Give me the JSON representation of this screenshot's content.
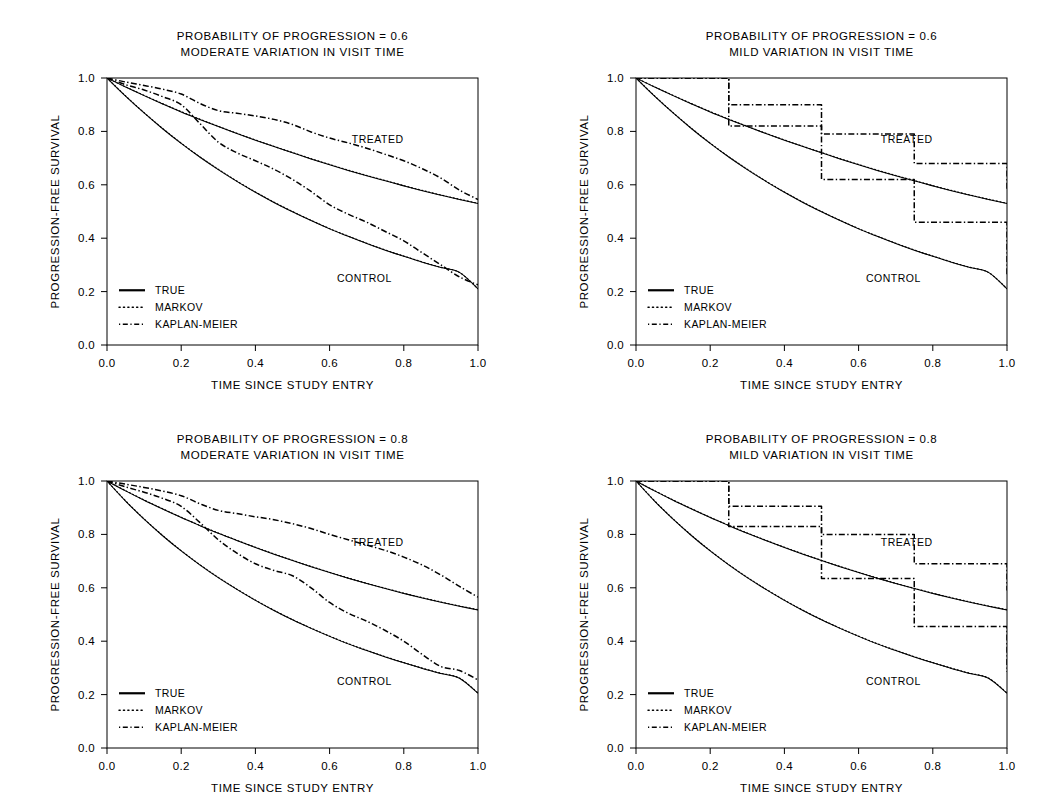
{
  "figure": {
    "name": "progression-free-survival-simulation",
    "panel_count": 4,
    "background_color": "#ffffff",
    "ink_color": "#000000"
  },
  "axes": {
    "xlabel": "TIME SINCE STUDY ENTRY",
    "ylabel": "PROGRESSION-FREE SURVIVAL",
    "xticks": [
      "0.0",
      "0.2",
      "0.4",
      "0.6",
      "0.8",
      "1.0"
    ],
    "xtick_values": [
      0.0,
      0.2,
      0.4,
      0.6,
      0.8,
      1.0
    ],
    "yticks": [
      "0.0",
      "0.2",
      "0.4",
      "0.6",
      "0.8",
      "1.0"
    ],
    "ytick_values": [
      0.0,
      0.2,
      0.4,
      0.6,
      0.8,
      1.0
    ],
    "xlim": [
      0.0,
      1.0
    ],
    "ylim": [
      0.0,
      1.0
    ],
    "grid": false
  },
  "legend": {
    "position": "bottom-left",
    "entries": [
      {
        "label": "TRUE",
        "style": "solid",
        "series_key": "true"
      },
      {
        "label": "MARKOV",
        "style": "dotted",
        "series_key": "markov"
      },
      {
        "label": "KAPLAN-MEIER",
        "style": "dash-dot",
        "series_key": "kaplan_meier"
      }
    ]
  },
  "annotations": {
    "treated": "TREATED",
    "control": "CONTROL"
  },
  "chart_data": [
    {
      "id": "panel-top-left",
      "type": "line",
      "title_line1": "PROBABILITY OF PROGRESSION = 0.6",
      "title_line2": "MODERATE VARIATION IN VISIT TIME",
      "probability_of_progression": 0.6,
      "visit_time_variation": "MODERATE",
      "xlabel": "TIME SINCE STUDY ENTRY",
      "ylabel": "PROGRESSION-FREE SURVIVAL",
      "xlim": [
        0.0,
        1.0
      ],
      "ylim": [
        0.0,
        1.0
      ],
      "x": [
        0.0,
        0.05,
        0.1,
        0.15,
        0.2,
        0.25,
        0.3,
        0.35,
        0.4,
        0.45,
        0.5,
        0.55,
        0.6,
        0.65,
        0.7,
        0.75,
        0.8,
        0.85,
        0.9,
        0.95,
        1.0
      ],
      "series": [
        {
          "name": "TRUE",
          "arm": "TREATED",
          "style": "solid",
          "values": [
            1.0,
            0.966,
            0.934,
            0.903,
            0.873,
            0.845,
            0.818,
            0.792,
            0.767,
            0.743,
            0.72,
            0.697,
            0.675,
            0.654,
            0.634,
            0.615,
            0.596,
            0.578,
            0.561,
            0.545,
            0.53
          ]
        },
        {
          "name": "MARKOV",
          "arm": "TREATED",
          "style": "dotted",
          "values": [
            1.0,
            0.967,
            0.935,
            0.904,
            0.874,
            0.846,
            0.819,
            0.793,
            0.768,
            0.744,
            0.721,
            0.698,
            0.676,
            0.655,
            0.635,
            0.616,
            0.597,
            0.579,
            0.562,
            0.546,
            0.531
          ]
        },
        {
          "name": "KAPLAN-MEIER",
          "arm": "TREATED",
          "style": "dash-dot",
          "values": [
            1.0,
            0.985,
            0.972,
            0.958,
            0.94,
            0.905,
            0.878,
            0.868,
            0.858,
            0.845,
            0.826,
            0.798,
            0.775,
            0.757,
            0.737,
            0.714,
            0.69,
            0.66,
            0.625,
            0.58,
            0.545
          ]
        },
        {
          "name": "TRUE",
          "arm": "CONTROL",
          "style": "solid",
          "values": [
            1.0,
            0.932,
            0.869,
            0.81,
            0.755,
            0.704,
            0.657,
            0.613,
            0.572,
            0.534,
            0.499,
            0.466,
            0.435,
            0.407,
            0.38,
            0.355,
            0.332,
            0.31,
            0.29,
            0.272,
            0.21
          ]
        },
        {
          "name": "MARKOV",
          "arm": "CONTROL",
          "style": "dotted",
          "values": [
            1.0,
            0.933,
            0.87,
            0.811,
            0.756,
            0.705,
            0.658,
            0.614,
            0.573,
            0.535,
            0.5,
            0.467,
            0.436,
            0.408,
            0.381,
            0.356,
            0.333,
            0.311,
            0.291,
            0.272,
            0.211
          ]
        },
        {
          "name": "KAPLAN-MEIER",
          "arm": "CONTROL",
          "style": "dash-dot",
          "values": [
            1.0,
            0.975,
            0.955,
            0.93,
            0.9,
            0.83,
            0.76,
            0.72,
            0.69,
            0.658,
            0.62,
            0.575,
            0.525,
            0.49,
            0.46,
            0.425,
            0.39,
            0.345,
            0.3,
            0.255,
            0.225
          ]
        }
      ]
    },
    {
      "id": "panel-top-right",
      "type": "line",
      "title_line1": "PROBABILITY OF PROGRESSION = 0.6",
      "title_line2": "MILD VARIATION IN VISIT TIME",
      "probability_of_progression": 0.6,
      "visit_time_variation": "MILD",
      "xlabel": "TIME SINCE STUDY ENTRY",
      "ylabel": "PROGRESSION-FREE SURVIVAL",
      "xlim": [
        0.0,
        1.0
      ],
      "ylim": [
        0.0,
        1.0
      ],
      "x": [
        0.0,
        0.05,
        0.1,
        0.15,
        0.2,
        0.25,
        0.3,
        0.35,
        0.4,
        0.45,
        0.5,
        0.55,
        0.6,
        0.65,
        0.7,
        0.75,
        0.8,
        0.85,
        0.9,
        0.95,
        1.0
      ],
      "series": [
        {
          "name": "TRUE",
          "arm": "TREATED",
          "style": "solid",
          "values": [
            1.0,
            0.966,
            0.934,
            0.903,
            0.873,
            0.845,
            0.818,
            0.792,
            0.767,
            0.743,
            0.72,
            0.697,
            0.675,
            0.654,
            0.634,
            0.615,
            0.596,
            0.578,
            0.561,
            0.545,
            0.53
          ]
        },
        {
          "name": "MARKOV",
          "arm": "TREATED",
          "style": "dotted",
          "values": [
            1.0,
            0.967,
            0.935,
            0.904,
            0.874,
            0.846,
            0.819,
            0.793,
            0.768,
            0.744,
            0.721,
            0.698,
            0.676,
            0.655,
            0.635,
            0.616,
            0.597,
            0.579,
            0.562,
            0.546,
            0.531
          ]
        },
        {
          "name": "KAPLAN-MEIER",
          "arm": "TREATED",
          "style": "dash-dot",
          "step_times": [
            0.0,
            0.25,
            0.5,
            0.75,
            1.0
          ],
          "step_values": [
            1.0,
            0.9,
            0.79,
            0.68,
            0.585
          ],
          "values": [
            1.0,
            0.985,
            0.97,
            0.955,
            0.94,
            0.9,
            0.9,
            0.89,
            0.88,
            0.87,
            0.79,
            0.78,
            0.77,
            0.76,
            0.75,
            0.68,
            0.67,
            0.665,
            0.66,
            0.655,
            0.585
          ]
        },
        {
          "name": "TRUE",
          "arm": "CONTROL",
          "style": "solid",
          "values": [
            1.0,
            0.932,
            0.869,
            0.81,
            0.755,
            0.704,
            0.657,
            0.613,
            0.572,
            0.534,
            0.499,
            0.466,
            0.435,
            0.407,
            0.38,
            0.355,
            0.332,
            0.31,
            0.29,
            0.272,
            0.21
          ]
        },
        {
          "name": "MARKOV",
          "arm": "CONTROL",
          "style": "dotted",
          "values": [
            1.0,
            0.933,
            0.87,
            0.811,
            0.756,
            0.705,
            0.658,
            0.614,
            0.573,
            0.535,
            0.5,
            0.467,
            0.436,
            0.408,
            0.381,
            0.356,
            0.333,
            0.311,
            0.291,
            0.272,
            0.211
          ]
        },
        {
          "name": "KAPLAN-MEIER",
          "arm": "CONTROL",
          "style": "dash-dot",
          "step_times": [
            0.0,
            0.25,
            0.5,
            0.75,
            1.0
          ],
          "step_values": [
            1.0,
            0.82,
            0.62,
            0.46,
            0.265
          ],
          "values": [
            1.0,
            0.97,
            0.94,
            0.9,
            0.87,
            0.82,
            0.8,
            0.78,
            0.76,
            0.74,
            0.62,
            0.6,
            0.58,
            0.56,
            0.54,
            0.46,
            0.45,
            0.44,
            0.43,
            0.42,
            0.265
          ]
        }
      ]
    },
    {
      "id": "panel-bottom-left",
      "type": "line",
      "title_line1": "PROBABILITY OF PROGRESSION = 0.8",
      "title_line2": "MODERATE VARIATION IN VISIT TIME",
      "probability_of_progression": 0.8,
      "visit_time_variation": "MODERATE",
      "xlabel": "TIME SINCE STUDY ENTRY",
      "ylabel": "PROGRESSION-FREE SURVIVAL",
      "xlim": [
        0.0,
        1.0
      ],
      "ylim": [
        0.0,
        1.0
      ],
      "x": [
        0.0,
        0.05,
        0.1,
        0.15,
        0.2,
        0.25,
        0.3,
        0.35,
        0.4,
        0.45,
        0.5,
        0.55,
        0.6,
        0.65,
        0.7,
        0.75,
        0.8,
        0.85,
        0.9,
        0.95,
        1.0
      ],
      "series": [
        {
          "name": "TRUE",
          "arm": "TREATED",
          "style": "solid",
          "values": [
            1.0,
            0.963,
            0.928,
            0.895,
            0.863,
            0.833,
            0.804,
            0.777,
            0.751,
            0.726,
            0.702,
            0.679,
            0.657,
            0.636,
            0.616,
            0.597,
            0.579,
            0.562,
            0.546,
            0.531,
            0.517
          ]
        },
        {
          "name": "MARKOV",
          "arm": "TREATED",
          "style": "dotted",
          "values": [
            1.0,
            0.964,
            0.929,
            0.896,
            0.864,
            0.834,
            0.805,
            0.778,
            0.752,
            0.727,
            0.703,
            0.68,
            0.658,
            0.637,
            0.617,
            0.598,
            0.58,
            0.563,
            0.547,
            0.532,
            0.518
          ]
        },
        {
          "name": "KAPLAN-MEIER",
          "arm": "TREATED",
          "style": "dash-dot",
          "values": [
            1.0,
            0.988,
            0.976,
            0.962,
            0.945,
            0.915,
            0.89,
            0.878,
            0.866,
            0.855,
            0.84,
            0.822,
            0.8,
            0.78,
            0.76,
            0.74,
            0.715,
            0.685,
            0.648,
            0.605,
            0.565
          ]
        },
        {
          "name": "TRUE",
          "arm": "CONTROL",
          "style": "solid",
          "values": [
            1.0,
            0.925,
            0.857,
            0.795,
            0.738,
            0.686,
            0.638,
            0.594,
            0.553,
            0.515,
            0.48,
            0.448,
            0.418,
            0.39,
            0.365,
            0.341,
            0.319,
            0.298,
            0.279,
            0.261,
            0.205
          ]
        },
        {
          "name": "MARKOV",
          "arm": "CONTROL",
          "style": "dotted",
          "values": [
            1.0,
            0.926,
            0.858,
            0.796,
            0.739,
            0.687,
            0.639,
            0.595,
            0.554,
            0.516,
            0.481,
            0.449,
            0.419,
            0.391,
            0.366,
            0.342,
            0.32,
            0.299,
            0.28,
            0.262,
            0.206
          ]
        },
        {
          "name": "KAPLAN-MEIER",
          "arm": "CONTROL",
          "style": "dash-dot",
          "values": [
            1.0,
            0.978,
            0.958,
            0.935,
            0.905,
            0.845,
            0.78,
            0.73,
            0.69,
            0.665,
            0.645,
            0.6,
            0.545,
            0.505,
            0.475,
            0.44,
            0.4,
            0.35,
            0.305,
            0.29,
            0.255
          ]
        }
      ]
    },
    {
      "id": "panel-bottom-right",
      "type": "line",
      "title_line1": "PROBABILITY OF PROGRESSION = 0.8",
      "title_line2": "MILD VARIATION IN VISIT TIME",
      "probability_of_progression": 0.8,
      "visit_time_variation": "MILD",
      "xlabel": "TIME SINCE STUDY ENTRY",
      "ylabel": "PROGRESSION-FREE SURVIVAL",
      "xlim": [
        0.0,
        1.0
      ],
      "ylim": [
        0.0,
        1.0
      ],
      "x": [
        0.0,
        0.05,
        0.1,
        0.15,
        0.2,
        0.25,
        0.3,
        0.35,
        0.4,
        0.45,
        0.5,
        0.55,
        0.6,
        0.65,
        0.7,
        0.75,
        0.8,
        0.85,
        0.9,
        0.95,
        1.0
      ],
      "series": [
        {
          "name": "TRUE",
          "arm": "TREATED",
          "style": "solid",
          "values": [
            1.0,
            0.963,
            0.928,
            0.895,
            0.863,
            0.833,
            0.804,
            0.777,
            0.751,
            0.726,
            0.702,
            0.679,
            0.657,
            0.636,
            0.616,
            0.597,
            0.579,
            0.562,
            0.546,
            0.531,
            0.517
          ]
        },
        {
          "name": "MARKOV",
          "arm": "TREATED",
          "style": "dotted",
          "values": [
            1.0,
            0.964,
            0.929,
            0.896,
            0.864,
            0.834,
            0.805,
            0.778,
            0.752,
            0.727,
            0.703,
            0.68,
            0.658,
            0.637,
            0.617,
            0.598,
            0.58,
            0.563,
            0.547,
            0.532,
            0.518
          ]
        },
        {
          "name": "KAPLAN-MEIER",
          "arm": "TREATED",
          "style": "dash-dot",
          "step_times": [
            0.0,
            0.25,
            0.5,
            0.75,
            1.0
          ],
          "step_values": [
            1.0,
            0.905,
            0.8,
            0.69,
            0.59
          ],
          "values": [
            1.0,
            0.987,
            0.972,
            0.958,
            0.94,
            0.905,
            0.9,
            0.895,
            0.89,
            0.885,
            0.8,
            0.79,
            0.785,
            0.78,
            0.775,
            0.69,
            0.685,
            0.68,
            0.675,
            0.67,
            0.59
          ]
        },
        {
          "name": "TRUE",
          "arm": "CONTROL",
          "style": "solid",
          "values": [
            1.0,
            0.925,
            0.857,
            0.795,
            0.738,
            0.686,
            0.638,
            0.594,
            0.553,
            0.515,
            0.48,
            0.448,
            0.418,
            0.39,
            0.365,
            0.341,
            0.319,
            0.298,
            0.279,
            0.261,
            0.205
          ]
        },
        {
          "name": "MARKOV",
          "arm": "CONTROL",
          "style": "dotted",
          "values": [
            1.0,
            0.926,
            0.858,
            0.796,
            0.739,
            0.687,
            0.639,
            0.595,
            0.554,
            0.516,
            0.481,
            0.449,
            0.419,
            0.391,
            0.366,
            0.342,
            0.32,
            0.299,
            0.28,
            0.262,
            0.206
          ]
        },
        {
          "name": "KAPLAN-MEIER",
          "arm": "CONTROL",
          "style": "dash-dot",
          "step_times": [
            0.0,
            0.25,
            0.5,
            0.75,
            1.0
          ],
          "step_values": [
            1.0,
            0.83,
            0.635,
            0.455,
            0.285
          ],
          "values": [
            1.0,
            0.975,
            0.945,
            0.91,
            0.875,
            0.83,
            0.81,
            0.795,
            0.78,
            0.765,
            0.635,
            0.62,
            0.605,
            0.595,
            0.585,
            0.455,
            0.45,
            0.445,
            0.44,
            0.435,
            0.285
          ]
        }
      ]
    }
  ]
}
